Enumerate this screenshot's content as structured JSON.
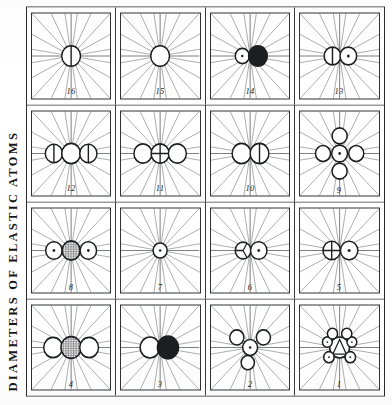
{
  "plate": {
    "title": "DIAMETERS OF ELASTIC ATOMS",
    "orientation": "rotated-90-ccw",
    "grid": {
      "rows": 4,
      "columns": 4,
      "cell_count": 16
    },
    "ink_color": "#1d1e20",
    "paper_color": "#ffffff",
    "rule_color": "#3a3b3d"
  },
  "legend": {
    "ray_count_per_cell": 20,
    "symbol_glyphs": [
      "open-circle",
      "dotted-circle",
      "hatched-circle",
      "solid-circle",
      "barred-circle",
      "crossed-circle",
      "trefoil-circle",
      "triangle-circle"
    ]
  },
  "cells": [
    {
      "number": "1",
      "name": "figure-1",
      "rays": 20,
      "atoms": [
        {
          "glyph": "triangle-circle",
          "cx": 50,
          "cy": 50,
          "r": 12.5
        },
        {
          "glyph": "dotted-circle",
          "cx": 38.5,
          "cy": 36.5,
          "r": 6.6
        },
        {
          "glyph": "dotted-circle",
          "cx": 56.5,
          "cy": 34.5,
          "r": 6.2
        },
        {
          "glyph": "open-circle",
          "cx": 66.5,
          "cy": 41.0,
          "r": 6.4
        },
        {
          "glyph": "dotted-circle",
          "cx": 38.5,
          "cy": 63.5,
          "r": 6.6
        },
        {
          "glyph": "dotted-circle",
          "cx": 56.5,
          "cy": 65.5,
          "r": 6.2
        },
        {
          "glyph": "open-circle",
          "cx": 66.5,
          "cy": 59.0,
          "r": 6.4
        }
      ]
    },
    {
      "number": "2",
      "name": "figure-2",
      "rays": 20,
      "atoms": [
        {
          "glyph": "dotted-circle",
          "cx": 50,
          "cy": 50,
          "r": 9.5
        },
        {
          "glyph": "open-circle",
          "cx": 32,
          "cy": 47,
          "r": 8.5
        },
        {
          "glyph": "open-circle",
          "cx": 62,
          "cy": 33,
          "r": 9.0
        },
        {
          "glyph": "open-circle",
          "cx": 62,
          "cy": 67,
          "r": 9.0
        }
      ]
    },
    {
      "number": "3",
      "name": "figure-3",
      "rays": 20,
      "atoms": [
        {
          "glyph": "open-circle",
          "cx": 50,
          "cy": 37,
          "r": 12.5
        },
        {
          "glyph": "solid-circle",
          "cx": 50,
          "cy": 60,
          "r": 13.5
        }
      ]
    },
    {
      "number": "4",
      "name": "figure-4",
      "rays": 20,
      "atoms": [
        {
          "glyph": "open-circle",
          "cx": 50,
          "cy": 27,
          "r": 12.0
        },
        {
          "glyph": "hatched-circle",
          "cx": 50,
          "cy": 50,
          "r": 13.0
        },
        {
          "glyph": "open-circle",
          "cx": 50,
          "cy": 73,
          "r": 12.0
        }
      ]
    },
    {
      "number": "5",
      "name": "figure-5",
      "rays": 20,
      "atoms": [
        {
          "glyph": "crossed-circle",
          "cx": 50,
          "cy": 40,
          "r": 11.0
        },
        {
          "glyph": "dotted-circle",
          "cx": 50,
          "cy": 62,
          "r": 11.0
        }
      ]
    },
    {
      "number": "6",
      "name": "figure-6",
      "rays": 20,
      "atoms": [
        {
          "glyph": "trefoil-circle",
          "cx": 50,
          "cy": 41,
          "r": 10.0
        },
        {
          "glyph": "dotted-circle",
          "cx": 50,
          "cy": 61,
          "r": 10.5
        }
      ]
    },
    {
      "number": "7",
      "name": "figure-7",
      "rays": 20,
      "atoms": [
        {
          "glyph": "dotted-circle",
          "cx": 50,
          "cy": 50,
          "r": 9.0
        }
      ]
    },
    {
      "number": "8",
      "name": "figure-8",
      "rays": 20,
      "atoms": [
        {
          "glyph": "dotted-circle",
          "cx": 50,
          "cy": 28,
          "r": 10.5
        },
        {
          "glyph": "hatched-circle",
          "cx": 50,
          "cy": 50,
          "r": 11.5
        },
        {
          "glyph": "dotted-circle",
          "cx": 50,
          "cy": 72,
          "r": 10.5
        }
      ]
    },
    {
      "number": "9",
      "name": "figure-9",
      "rays": 20,
      "atoms": [
        {
          "glyph": "dotted-circle",
          "cx": 50,
          "cy": 50,
          "r": 10.0
        },
        {
          "glyph": "open-circle",
          "cx": 50,
          "cy": 29,
          "r": 9.5
        },
        {
          "glyph": "open-circle",
          "cx": 50,
          "cy": 71,
          "r": 9.5
        },
        {
          "glyph": "open-circle",
          "cx": 29,
          "cy": 50,
          "r": 9.5
        },
        {
          "glyph": "open-circle",
          "cx": 71,
          "cy": 50,
          "r": 9.5
        }
      ]
    },
    {
      "number": "10",
      "name": "figure-10",
      "rays": 20,
      "atoms": [
        {
          "glyph": "open-circle",
          "cx": 50,
          "cy": 39,
          "r": 12.0
        },
        {
          "glyph": "barred-circle",
          "cx": 50,
          "cy": 62,
          "r": 12.0
        }
      ]
    },
    {
      "number": "11",
      "name": "figure-11",
      "rays": 20,
      "atoms": [
        {
          "glyph": "open-circle",
          "cx": 50,
          "cy": 28,
          "r": 11.5
        },
        {
          "glyph": "crossed-circle",
          "cx": 50,
          "cy": 50,
          "r": 11.5
        },
        {
          "glyph": "open-circle",
          "cx": 50,
          "cy": 72,
          "r": 11.5
        }
      ]
    },
    {
      "number": "12",
      "name": "figure-12",
      "rays": 20,
      "atoms": [
        {
          "glyph": "barred-circle",
          "cx": 50,
          "cy": 28,
          "r": 11.0
        },
        {
          "glyph": "open-circle",
          "cx": 50,
          "cy": 50,
          "r": 12.0
        },
        {
          "glyph": "barred-circle",
          "cx": 50,
          "cy": 72,
          "r": 11.0
        }
      ]
    },
    {
      "number": "13",
      "name": "figure-13",
      "rays": 20,
      "atoms": [
        {
          "glyph": "barred-circle",
          "cx": 50,
          "cy": 41,
          "r": 10.5
        },
        {
          "glyph": "dotted-circle",
          "cx": 50,
          "cy": 61,
          "r": 10.5
        }
      ]
    },
    {
      "number": "14",
      "name": "figure-14",
      "rays": 20,
      "atoms": [
        {
          "glyph": "dotted-circle",
          "cx": 50,
          "cy": 40,
          "r": 9.0
        },
        {
          "glyph": "solid-circle",
          "cx": 50,
          "cy": 60,
          "r": 12.0
        }
      ]
    },
    {
      "number": "15",
      "name": "figure-15",
      "rays": 20,
      "atoms": [
        {
          "glyph": "open-circle",
          "cx": 50,
          "cy": 50,
          "r": 12.0
        }
      ]
    },
    {
      "number": "16",
      "name": "figure-16",
      "rays": 20,
      "atoms": [
        {
          "glyph": "barred-circle",
          "cx": 50,
          "cy": 50,
          "r": 12.0
        }
      ]
    }
  ]
}
